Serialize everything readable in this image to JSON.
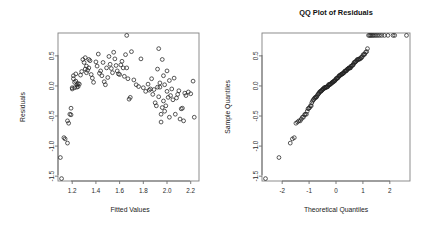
{
  "figure": {
    "background": "#ffffff",
    "point_color": "#222222",
    "axis_color": "#6e6e6e",
    "frame_color": "#808080",
    "width": 425,
    "height": 238
  },
  "panels": [
    {
      "name": "residuals-vs-fitted",
      "title": "",
      "xlabel": "Fitted Values",
      "ylabel": "Residuals",
      "xticks": [
        "1.2",
        "1.4",
        "1.6",
        "1.8",
        "2.0",
        "2.2"
      ],
      "yticks": [
        "0.5",
        "0.0",
        "-0.5",
        "-1.0",
        "-1.5"
      ]
    },
    {
      "name": "qq-plot-residuals",
      "title": "QQ Plot of Residuals",
      "xlabel": "Theoretical Quantiles",
      "ylabel": "Sample Quantiles",
      "xticks": [
        "-2",
        "-1",
        "0",
        "1",
        "2"
      ],
      "yticks": [
        "0.5",
        "0.0",
        "-0.5",
        "-1.0",
        "-1.5"
      ]
    }
  ],
  "chart_data": [
    {
      "type": "scatter",
      "title": "",
      "xlabel": "Fitted Values",
      "ylabel": "Residuals",
      "xlim": [
        1.08,
        2.27
      ],
      "ylim": [
        -1.58,
        0.88
      ],
      "xticks": [
        1.2,
        1.4,
        1.6,
        1.8,
        2.0,
        2.2
      ],
      "yticks": [
        0.5,
        0.0,
        -0.5,
        -1.0,
        -1.5
      ],
      "grid": false,
      "legend": null,
      "marker": "open-circle",
      "x": [
        1.1,
        1.11,
        1.13,
        1.14,
        1.16,
        1.16,
        1.17,
        1.18,
        1.19,
        1.19,
        1.2,
        1.2,
        1.21,
        1.21,
        1.22,
        1.22,
        1.23,
        1.23,
        1.24,
        1.24,
        1.25,
        1.25,
        1.26,
        1.27,
        1.28,
        1.29,
        1.3,
        1.31,
        1.31,
        1.32,
        1.32,
        1.33,
        1.34,
        1.34,
        1.35,
        1.36,
        1.37,
        1.38,
        1.4,
        1.41,
        1.42,
        1.43,
        1.44,
        1.45,
        1.46,
        1.47,
        1.48,
        1.49,
        1.5,
        1.51,
        1.52,
        1.53,
        1.54,
        1.55,
        1.56,
        1.57,
        1.58,
        1.59,
        1.6,
        1.61,
        1.62,
        1.63,
        1.64,
        1.65,
        1.66,
        1.66,
        1.67,
        1.68,
        1.69,
        1.7,
        1.72,
        1.74,
        1.76,
        1.78,
        1.8,
        1.82,
        1.84,
        1.85,
        1.86,
        1.87,
        1.88,
        1.89,
        1.9,
        1.91,
        1.92,
        1.92,
        1.93,
        1.93,
        1.94,
        1.94,
        1.95,
        1.95,
        1.96,
        1.96,
        1.97,
        1.97,
        1.98,
        1.98,
        1.99,
        2.0,
        2.0,
        2.01,
        2.02,
        2.02,
        2.03,
        2.04,
        2.05,
        2.06,
        2.07,
        2.08,
        2.09,
        2.1,
        2.11,
        2.12,
        2.13,
        2.14,
        2.15,
        2.16,
        2.18,
        2.2,
        2.22,
        2.23
      ],
      "y": [
        -1.19,
        -1.54,
        -0.86,
        -0.88,
        -0.95,
        -0.58,
        -0.62,
        -0.47,
        -0.48,
        -0.37,
        -0.03,
        -0.05,
        0.17,
        0.12,
        0.06,
        -0.03,
        0.2,
        0.08,
        0.02,
        -0.02,
        0.04,
        -0.01,
        0.03,
        0.18,
        0.24,
        0.44,
        0.39,
        0.47,
        0.28,
        0.33,
        0.22,
        0.26,
        0.44,
        0.3,
        0.42,
        0.19,
        0.13,
        0.06,
        0.4,
        0.33,
        0.53,
        0.21,
        0.25,
        0.17,
        0.39,
        0.07,
        0.02,
        0.3,
        0.14,
        0.49,
        0.36,
        0.29,
        0.22,
        0.56,
        0.45,
        0.34,
        0.25,
        0.2,
        0.19,
        0.35,
        0.41,
        0.3,
        0.16,
        0.52,
        0.84,
        0.3,
        0.12,
        -0.22,
        -0.19,
        0.57,
        0.1,
        0.02,
        -0.01,
        0.45,
        -0.03,
        -0.09,
        0.03,
        -0.07,
        -0.05,
        0.12,
        -0.14,
        -0.06,
        -0.28,
        -0.33,
        0.28,
        -0.02,
        0.62,
        -0.18,
        0.05,
        -0.02,
        -0.47,
        -0.6,
        0.44,
        -0.36,
        0.17,
        -0.25,
        0.02,
        -0.42,
        -0.33,
        0.25,
        -0.09,
        -0.19,
        0.09,
        -0.52,
        -0.16,
        -0.05,
        -0.23,
        0.13,
        -0.47,
        -0.2,
        -0.14,
        -0.08,
        -0.55,
        -0.38,
        -0.37,
        -0.58,
        -0.12,
        -0.16,
        -0.1,
        -0.13,
        0.08,
        -0.52
      ]
    },
    {
      "type": "scatter",
      "title": "QQ Plot of Residuals",
      "xlabel": "Theoretical Quantiles",
      "ylabel": "Sample Quantiles",
      "xlim": [
        -2.75,
        2.75
      ],
      "ylim": [
        -1.58,
        0.88
      ],
      "xticks": [
        -2,
        -1,
        0,
        1,
        2
      ],
      "yticks": [
        0.5,
        0.0,
        -0.5,
        -1.0,
        -1.5
      ],
      "grid": false,
      "legend": null,
      "marker": "open-circle",
      "reference_note": "normal probability plot of the same residuals, sorted",
      "x": [
        -2.62,
        -2.12,
        -1.7,
        -1.62,
        -1.55,
        -1.49,
        -1.43,
        -1.38,
        -1.33,
        -1.29,
        -1.25,
        -1.21,
        -1.17,
        -1.14,
        -1.1,
        -1.07,
        -1.04,
        -1.01,
        -0.98,
        -0.95,
        -0.92,
        -0.9,
        -0.87,
        -0.84,
        -0.82,
        -0.79,
        -0.77,
        -0.74,
        -0.72,
        -0.7,
        -0.67,
        -0.65,
        -0.63,
        -0.61,
        -0.58,
        -0.56,
        -0.54,
        -0.52,
        -0.5,
        -0.48,
        -0.46,
        -0.44,
        -0.42,
        -0.4,
        -0.38,
        -0.36,
        -0.34,
        -0.32,
        -0.3,
        -0.28,
        -0.26,
        -0.24,
        -0.22,
        -0.2,
        -0.18,
        -0.16,
        -0.14,
        -0.12,
        -0.1,
        -0.08,
        -0.06,
        -0.04,
        -0.02,
        0.0,
        0.02,
        0.04,
        0.06,
        0.08,
        0.1,
        0.12,
        0.14,
        0.16,
        0.18,
        0.2,
        0.22,
        0.24,
        0.26,
        0.28,
        0.3,
        0.32,
        0.34,
        0.36,
        0.38,
        0.4,
        0.42,
        0.44,
        0.46,
        0.48,
        0.5,
        0.52,
        0.54,
        0.56,
        0.58,
        0.61,
        0.63,
        0.65,
        0.67,
        0.7,
        0.72,
        0.74,
        0.77,
        0.79,
        0.82,
        0.84,
        0.87,
        0.9,
        0.92,
        0.95,
        0.98,
        1.01,
        1.04,
        1.07,
        1.1,
        1.14,
        1.17,
        1.21,
        1.25,
        1.29,
        1.33,
        1.38,
        1.43,
        1.49,
        1.55,
        1.62,
        1.7,
        1.8,
        1.93,
        2.12,
        2.18,
        2.62
      ],
      "y": [
        -1.54,
        -1.19,
        -0.95,
        -0.88,
        -0.86,
        -0.62,
        -0.6,
        -0.58,
        -0.58,
        -0.55,
        -0.52,
        -0.52,
        -0.48,
        -0.47,
        -0.47,
        -0.42,
        -0.38,
        -0.37,
        -0.36,
        -0.33,
        -0.33,
        -0.28,
        -0.25,
        -0.23,
        -0.22,
        -0.2,
        -0.19,
        -0.19,
        -0.18,
        -0.16,
        -0.14,
        -0.13,
        -0.12,
        -0.1,
        -0.09,
        -0.09,
        -0.08,
        -0.07,
        -0.06,
        -0.05,
        -0.05,
        -0.03,
        -0.03,
        -0.03,
        -0.02,
        -0.02,
        -0.02,
        -0.01,
        -0.01,
        0.02,
        0.02,
        0.02,
        0.03,
        0.03,
        0.04,
        0.05,
        0.06,
        0.06,
        0.07,
        0.08,
        0.08,
        0.09,
        0.1,
        0.12,
        0.12,
        0.13,
        0.13,
        0.14,
        0.16,
        0.17,
        0.17,
        0.18,
        0.19,
        0.19,
        0.2,
        0.2,
        0.21,
        0.22,
        0.22,
        0.24,
        0.25,
        0.25,
        0.25,
        0.26,
        0.28,
        0.28,
        0.29,
        0.3,
        0.3,
        0.3,
        0.3,
        0.33,
        0.33,
        0.34,
        0.35,
        0.36,
        0.39,
        0.39,
        0.4,
        0.41,
        0.42,
        0.44,
        0.44,
        0.44,
        0.45,
        0.45,
        0.47,
        0.47,
        0.49,
        0.52,
        0.52,
        0.53,
        0.56,
        0.57,
        0.62,
        0.84,
        0.84,
        0.84,
        0.84,
        0.84,
        0.84,
        0.84,
        0.84,
        0.84,
        0.84,
        0.84,
        0.84,
        0.84,
        0.84,
        0.84
      ]
    }
  ]
}
